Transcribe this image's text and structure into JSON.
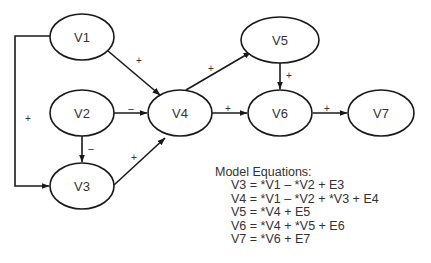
{
  "diagram": {
    "nodes": [
      {
        "id": "V1",
        "label": "V1",
        "cx": 82,
        "cy": 37,
        "rx": 32,
        "ry": 23
      },
      {
        "id": "V2",
        "label": "V2",
        "cx": 82,
        "cy": 113,
        "rx": 32,
        "ry": 23
      },
      {
        "id": "V3",
        "label": "V3",
        "cx": 82,
        "cy": 186,
        "rx": 32,
        "ry": 23
      },
      {
        "id": "V4",
        "label": "V4",
        "cx": 180,
        "cy": 113,
        "rx": 32,
        "ry": 23
      },
      {
        "id": "V5",
        "label": "V5",
        "cx": 280,
        "cy": 40,
        "rx": 39,
        "ry": 23
      },
      {
        "id": "V6",
        "label": "V6",
        "cx": 280,
        "cy": 113,
        "rx": 32,
        "ry": 23
      },
      {
        "id": "V7",
        "label": "V7",
        "cx": 381,
        "cy": 113,
        "rx": 33,
        "ry": 23
      }
    ],
    "edges": [
      {
        "from": "V1",
        "to": "V4",
        "sign": "+"
      },
      {
        "from": "V2",
        "to": "V4",
        "sign": "–"
      },
      {
        "from": "V2",
        "to": "V3",
        "sign": "–"
      },
      {
        "from": "V1",
        "to": "V3",
        "sign": "+"
      },
      {
        "from": "V3",
        "to": "V4",
        "sign": "+"
      },
      {
        "from": "V4",
        "to": "V5",
        "sign": "+"
      },
      {
        "from": "V4",
        "to": "V6",
        "sign": "+"
      },
      {
        "from": "V5",
        "to": "V6",
        "sign": "+"
      },
      {
        "from": "V6",
        "to": "V7",
        "sign": "+"
      }
    ]
  },
  "equations": {
    "title": "Model Equations:",
    "lines": [
      "V3 = *V1 – *V2 + E3",
      "V4 = *V1 – *V2 + *V3 + E4",
      "V5 = *V4 + E5",
      "V6 = *V4 + *V5 + E6",
      "V7 = *V6 + E7"
    ]
  }
}
